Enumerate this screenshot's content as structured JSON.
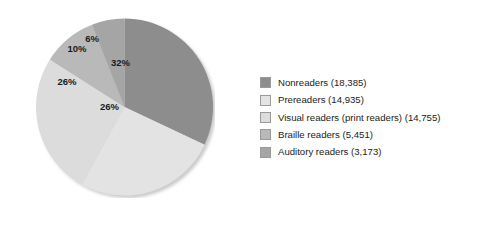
{
  "chart_data": {
    "type": "pie",
    "title": "",
    "subtitle": "",
    "xlabel": "",
    "ylabel": "",
    "grid": false,
    "legend_position": "right",
    "total": 56699,
    "start_angle_deg": 0,
    "direction": "clockwise",
    "categories": [
      "Nonreaders",
      "Prereaders",
      "Visual readers (print readers)",
      "Braille readers",
      "Auditory readers"
    ],
    "values": [
      18385,
      14935,
      14755,
      5451,
      3173
    ],
    "percent_labels": [
      "32%",
      "26%",
      "26%",
      "10%",
      "6%"
    ],
    "percent_values": [
      32,
      26,
      26,
      10,
      6
    ],
    "colors": [
      "#8d8d8d",
      "#e3e3e3",
      "#dcdcdc",
      "#b9b9b9",
      "#a5a5a5"
    ],
    "slices": [
      {
        "name": "Nonreaders",
        "count": 18385,
        "percent": 32,
        "label": "32%",
        "color": "#8d8d8d",
        "label_x": 169,
        "label_y": 90
      },
      {
        "name": "Prereaders",
        "count": 14935,
        "percent": 26,
        "label": "26%",
        "color": "#e3e3e3",
        "label_x": 147,
        "label_y": 178
      },
      {
        "name": "Visual readers (print readers)",
        "count": 14755,
        "percent": 26,
        "label": "26%",
        "color": "#dcdcdc",
        "label_x": 62,
        "label_y": 128
      },
      {
        "name": "Braille readers",
        "count": 5451,
        "percent": 10,
        "label": "10%",
        "color": "#b9b9b9",
        "label_x": 82,
        "label_y": 63
      },
      {
        "name": "Auditory readers",
        "count": 3173,
        "percent": 6,
        "label": "6%",
        "color": "#a5a5a5",
        "label_x": 112,
        "label_y": 42
      }
    ]
  },
  "legend": {
    "items": [
      {
        "label": "Nonreaders (18,385)",
        "color": "#8d8d8d",
        "swatch_name": "legend-swatch-nonreaders"
      },
      {
        "label": "Prereaders (14,935)",
        "color": "#e3e3e3",
        "swatch_name": "legend-swatch-prereaders"
      },
      {
        "label": "Visual readers (print readers) (14,755)",
        "color": "#dcdcdc",
        "swatch_name": "legend-swatch-visual-readers"
      },
      {
        "label": "Braille readers (5,451)",
        "color": "#b9b9b9",
        "swatch_name": "legend-swatch-braille-readers"
      },
      {
        "label": "Auditory readers (3,173)",
        "color": "#a5a5a5",
        "swatch_name": "legend-swatch-auditory-readers"
      }
    ]
  }
}
